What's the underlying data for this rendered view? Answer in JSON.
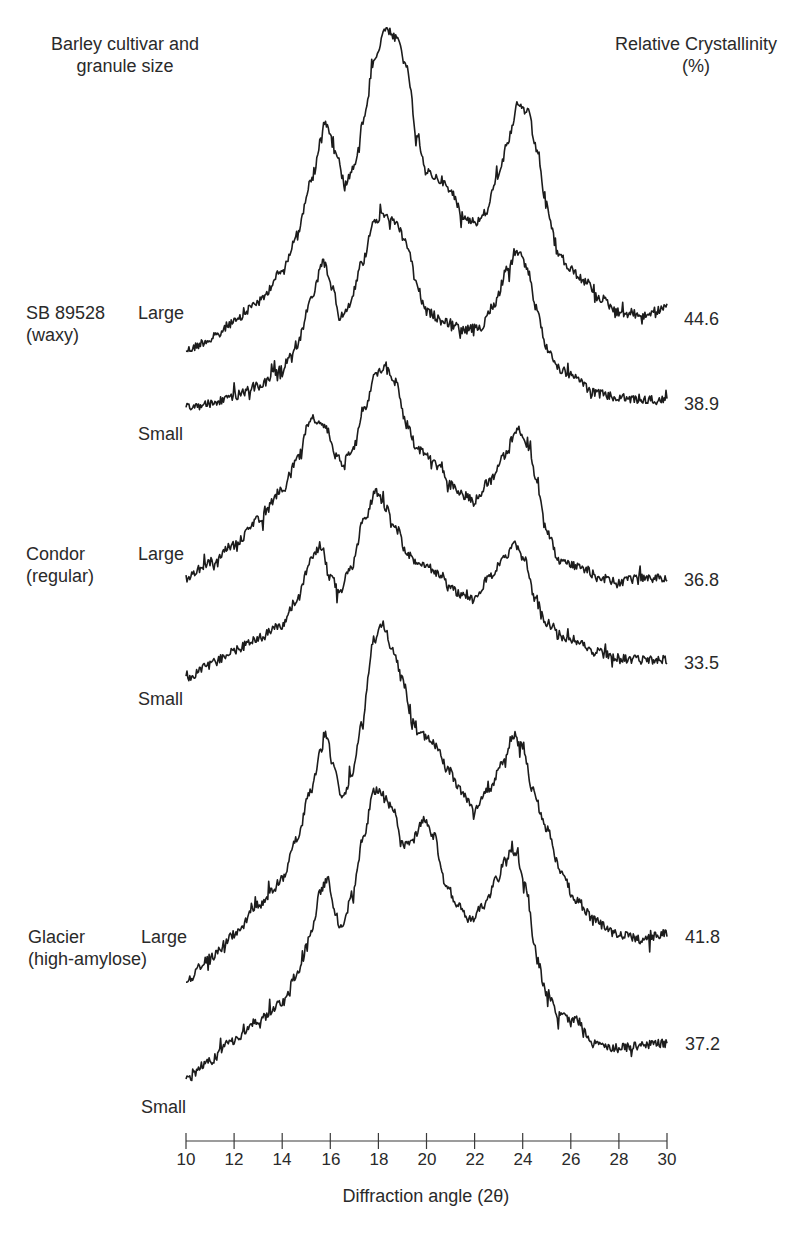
{
  "chart_data": {
    "type": "line",
    "title": "",
    "xlabel": "Diffraction angle (2θ)",
    "ylabel": "",
    "xlim": [
      10,
      30
    ],
    "x_ticks": [
      10,
      12,
      14,
      16,
      18,
      20,
      22,
      24,
      26,
      28,
      30
    ],
    "grid": false,
    "legend": "none (series labelled inline at left, crystallinity values at right)",
    "header_left": "Barley cultivar and granule size",
    "header_right": "Relative Crystallinity (%)",
    "note": "Stacked X-ray diffraction patterns (arbitrary intensity, vertically offset). Points are [2θ, screen-y px] key points of each trace.",
    "series": [
      {
        "name": "SB 89528 (waxy) Large",
        "cultivar": "SB 89528",
        "type_label": "(waxy)",
        "size": "Large",
        "crystallinity": 44.6,
        "points": [
          [
            10,
            350
          ],
          [
            11,
            340
          ],
          [
            12,
            322
          ],
          [
            13,
            302
          ],
          [
            14,
            272
          ],
          [
            14.6,
            235
          ],
          [
            15.2,
            182
          ],
          [
            15.8,
            122
          ],
          [
            16.2,
            150
          ],
          [
            16.6,
            182
          ],
          [
            17,
            168
          ],
          [
            17.4,
            120
          ],
          [
            17.8,
            62
          ],
          [
            18.3,
            28
          ],
          [
            18.8,
            40
          ],
          [
            19.2,
            70
          ],
          [
            19.6,
            140
          ],
          [
            20,
            172
          ],
          [
            20.6,
            180
          ],
          [
            21,
            192
          ],
          [
            21.6,
            218
          ],
          [
            22.1,
            222
          ],
          [
            22.5,
            212
          ],
          [
            22.9,
            178
          ],
          [
            23.4,
            140
          ],
          [
            23.8,
            105
          ],
          [
            24.2,
            112
          ],
          [
            24.6,
            150
          ],
          [
            25,
            210
          ],
          [
            25.5,
            255
          ],
          [
            26,
            270
          ],
          [
            26.6,
            282
          ],
          [
            27.2,
            298
          ],
          [
            28,
            312
          ],
          [
            29,
            315
          ],
          [
            30,
            308
          ]
        ]
      },
      {
        "name": "SB 89528 (waxy) Small",
        "cultivar": "SB 89528",
        "type_label": "(waxy)",
        "size": "Small",
        "crystallinity": 38.9,
        "points": [
          [
            10,
            408
          ],
          [
            11,
            404
          ],
          [
            12,
            396
          ],
          [
            13,
            386
          ],
          [
            14,
            370
          ],
          [
            14.6,
            345
          ],
          [
            15.2,
            300
          ],
          [
            15.7,
            262
          ],
          [
            16.1,
            290
          ],
          [
            16.4,
            318
          ],
          [
            16.8,
            305
          ],
          [
            17.3,
            265
          ],
          [
            17.8,
            222
          ],
          [
            18.2,
            215
          ],
          [
            18.7,
            222
          ],
          [
            19.2,
            245
          ],
          [
            19.6,
            285
          ],
          [
            20,
            312
          ],
          [
            20.8,
            322
          ],
          [
            21.6,
            330
          ],
          [
            22.2,
            328
          ],
          [
            22.8,
            305
          ],
          [
            23.4,
            268
          ],
          [
            23.8,
            252
          ],
          [
            24.2,
            270
          ],
          [
            24.6,
            310
          ],
          [
            25,
            350
          ],
          [
            25.6,
            370
          ],
          [
            26.2,
            378
          ],
          [
            27,
            393
          ],
          [
            28,
            398
          ],
          [
            29,
            400
          ],
          [
            30,
            400
          ]
        ]
      },
      {
        "name": "Condor (regular) Large",
        "cultivar": "Condor",
        "type_label": "(regular)",
        "size": "Large",
        "crystallinity": 36.8,
        "points": [
          [
            10,
            578
          ],
          [
            11,
            562
          ],
          [
            12,
            545
          ],
          [
            13,
            520
          ],
          [
            14,
            490
          ],
          [
            14.6,
            460
          ],
          [
            15.2,
            418
          ],
          [
            15.8,
            428
          ],
          [
            15.9,
            432
          ],
          [
            16.2,
            455
          ],
          [
            16.5,
            462
          ],
          [
            16.9,
            450
          ],
          [
            17.4,
            408
          ],
          [
            17.9,
            375
          ],
          [
            18.3,
            365
          ],
          [
            18.7,
            382
          ],
          [
            19.2,
            425
          ],
          [
            19.6,
            448
          ],
          [
            20,
            455
          ],
          [
            20.5,
            462
          ],
          [
            21,
            485
          ],
          [
            21.5,
            495
          ],
          [
            22,
            500
          ],
          [
            22.6,
            482
          ],
          [
            23.2,
            455
          ],
          [
            23.8,
            428
          ],
          [
            24.2,
            445
          ],
          [
            24.6,
            485
          ],
          [
            25,
            530
          ],
          [
            25.5,
            560
          ],
          [
            26,
            565
          ],
          [
            26.6,
            570
          ],
          [
            27.2,
            578
          ],
          [
            28,
            582
          ],
          [
            29,
            578
          ],
          [
            30,
            578
          ]
        ]
      },
      {
        "name": "Condor (regular) Small",
        "cultivar": "Condor",
        "type_label": "(regular)",
        "size": "Small",
        "crystallinity": 33.5,
        "points": [
          [
            10,
            678
          ],
          [
            11,
            665
          ],
          [
            12,
            650
          ],
          [
            13,
            638
          ],
          [
            14,
            625
          ],
          [
            14.6,
            600
          ],
          [
            15.2,
            560
          ],
          [
            15.6,
            545
          ],
          [
            16,
            578
          ],
          [
            16.4,
            590
          ],
          [
            16.9,
            565
          ],
          [
            17.4,
            520
          ],
          [
            17.9,
            492
          ],
          [
            18.3,
            508
          ],
          [
            18.8,
            530
          ],
          [
            19.2,
            555
          ],
          [
            19.6,
            562
          ],
          [
            20.1,
            568
          ],
          [
            20.6,
            575
          ],
          [
            21,
            590
          ],
          [
            21.6,
            595
          ],
          [
            22,
            600
          ],
          [
            22.6,
            578
          ],
          [
            23.2,
            560
          ],
          [
            23.7,
            545
          ],
          [
            24.1,
            560
          ],
          [
            24.5,
            600
          ],
          [
            25,
            622
          ],
          [
            25.6,
            638
          ],
          [
            26.2,
            640
          ],
          [
            27,
            652
          ],
          [
            28,
            658
          ],
          [
            29,
            660
          ],
          [
            30,
            660
          ]
        ]
      },
      {
        "name": "Glacier (high-amylose) Large",
        "cultivar": "Glacier",
        "type_label": "(high-amylose)",
        "size": "Large",
        "crystallinity": 41.8,
        "points": [
          [
            10,
            980
          ],
          [
            11,
            958
          ],
          [
            12,
            935
          ],
          [
            13,
            905
          ],
          [
            14,
            880
          ],
          [
            14.6,
            840
          ],
          [
            15.2,
            790
          ],
          [
            15.6,
            752
          ],
          [
            15.8,
            735
          ],
          [
            16.2,
            770
          ],
          [
            16.5,
            798
          ],
          [
            16.9,
            775
          ],
          [
            17.3,
            725
          ],
          [
            17.8,
            640
          ],
          [
            18.2,
            625
          ],
          [
            18.6,
            650
          ],
          [
            19,
            680
          ],
          [
            19.4,
            720
          ],
          [
            19.8,
            735
          ],
          [
            20.4,
            745
          ],
          [
            20.9,
            770
          ],
          [
            21.4,
            790
          ],
          [
            22,
            810
          ],
          [
            22.6,
            790
          ],
          [
            23.2,
            760
          ],
          [
            23.6,
            735
          ],
          [
            24,
            745
          ],
          [
            24.4,
            790
          ],
          [
            25,
            830
          ],
          [
            25.6,
            872
          ],
          [
            26.2,
            900
          ],
          [
            27,
            920
          ],
          [
            28,
            935
          ],
          [
            29,
            940
          ],
          [
            30,
            933
          ]
        ]
      },
      {
        "name": "Glacier (high-amylose) Small",
        "cultivar": "Glacier",
        "type_label": "(high-amylose)",
        "size": "Small",
        "crystallinity": 37.2,
        "points": [
          [
            10,
            1080
          ],
          [
            11,
            1060
          ],
          [
            12,
            1040
          ],
          [
            13,
            1020
          ],
          [
            14,
            1003
          ],
          [
            14.6,
            975
          ],
          [
            15.2,
            935
          ],
          [
            15.6,
            890
          ],
          [
            15.9,
            880
          ],
          [
            16.2,
            915
          ],
          [
            16.5,
            930
          ],
          [
            16.9,
            895
          ],
          [
            17.4,
            835
          ],
          [
            17.8,
            790
          ],
          [
            18.2,
            795
          ],
          [
            18.6,
            810
          ],
          [
            19,
            845
          ],
          [
            19.4,
            840
          ],
          [
            19.9,
            818
          ],
          [
            20.3,
            835
          ],
          [
            20.8,
            885
          ],
          [
            21.3,
            905
          ],
          [
            21.8,
            920
          ],
          [
            22.4,
            905
          ],
          [
            22.9,
            880
          ],
          [
            23.4,
            855
          ],
          [
            23.7,
            852
          ],
          [
            24.1,
            885
          ],
          [
            24.6,
            960
          ],
          [
            25,
            995
          ],
          [
            25.5,
            1015
          ],
          [
            26.2,
            1020
          ],
          [
            27,
            1045
          ],
          [
            28,
            1048
          ],
          [
            29,
            1045
          ],
          [
            30,
            1043
          ]
        ]
      }
    ]
  },
  "labels": {
    "header_left_line1": "Barley cultivar and",
    "header_left_line2": "granule size",
    "header_right_line1": "Relative Crystallinity",
    "header_right_line2": "(%)",
    "groups": [
      {
        "cultivar": "SB 89528",
        "type": "(waxy)"
      },
      {
        "cultivar": "Condor",
        "type": "(regular)"
      },
      {
        "cultivar": "Glacier",
        "type": "(high-amylose)"
      }
    ],
    "sizes": [
      "Large",
      "Small",
      "Large",
      "Small",
      "Large",
      "Small"
    ],
    "values": [
      "44.6",
      "38.9",
      "36.8",
      "33.5",
      "41.8",
      "37.2"
    ],
    "x_tick_labels": [
      "10",
      "12",
      "14",
      "16",
      "18",
      "20",
      "22",
      "24",
      "26",
      "28",
      "30"
    ],
    "xlabel": "Diffraction angle (2θ)"
  },
  "colors": {
    "trace": "#1c1c1c",
    "text": "#2a2a2a",
    "axis": "#3a3a3a",
    "background": "#ffffff"
  }
}
